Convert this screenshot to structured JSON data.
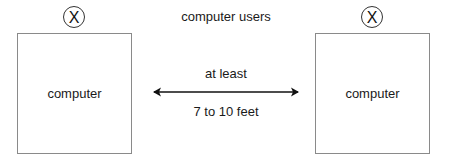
{
  "diagram": {
    "title": "computer users",
    "user_marker_glyph": "X",
    "left_station": {
      "label": "computer",
      "user_marker": "X"
    },
    "right_station": {
      "label": "computer",
      "user_marker": "X"
    },
    "distance": {
      "label_top": "at least",
      "label_bottom": "7 to 10 feet"
    }
  }
}
